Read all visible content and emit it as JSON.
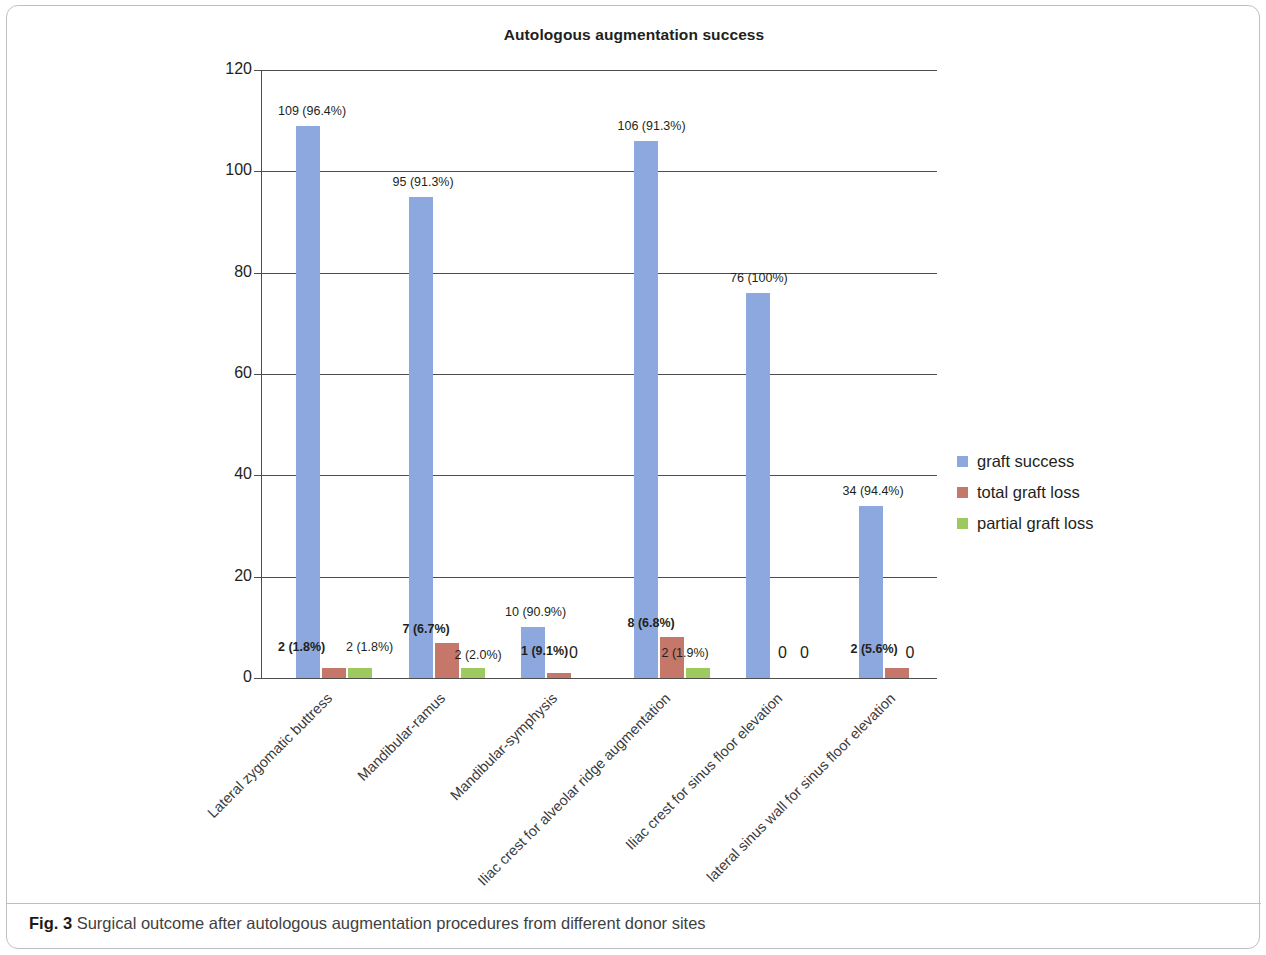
{
  "figure": {
    "caption_label": "Fig. 3",
    "caption_text": "Surgical outcome after autologous augmentation procedures from different donor sites"
  },
  "chart_data": {
    "type": "bar",
    "title": "Autologous augmentation success",
    "xlabel": "",
    "ylabel": "",
    "ylim": [
      0,
      120
    ],
    "yticks": [
      0,
      20,
      40,
      60,
      80,
      100,
      120
    ],
    "ytick_labels": [
      "0",
      "20",
      "40",
      "60",
      "80",
      "100",
      "120"
    ],
    "grid": true,
    "legend_position": "right",
    "categories": [
      "Lateral zygomatic buttress",
      "Mandibular-ramus",
      "Mandibular-symphysis",
      "Iliac crest for alveolar ridge augmentation",
      "Iliac crest for sinus floor elevation",
      "lateral sinus wall for sinus floor elevation"
    ],
    "series": [
      {
        "name": "graft success",
        "color": "#8ca8de",
        "values": [
          109,
          95,
          10,
          106,
          76,
          34
        ],
        "labels": [
          "109 (96.4%)",
          "95 (91.3%)",
          "10 (90.9%)",
          "106 (91.3%)",
          "76 (100%)",
          "34 (94.4%)"
        ]
      },
      {
        "name": "total graft loss",
        "color": "#c5776a",
        "values": [
          2,
          7,
          1,
          8,
          0,
          2
        ],
        "labels": [
          "2 (1.8%)",
          "7 (6.7%)",
          "1 (9.1%)",
          "8 (6.8%)",
          "0",
          "2 (5.6%)"
        ]
      },
      {
        "name": "partial graft loss",
        "color": "#9dc95f",
        "values": [
          2,
          2,
          0,
          2,
          0,
          0
        ],
        "labels": [
          "2 (1.8%)",
          "2 (2.0%)",
          "0",
          "2 (1.9%)",
          "0",
          "0"
        ]
      }
    ]
  }
}
